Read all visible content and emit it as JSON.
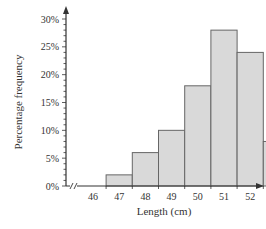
{
  "chart_data": {
    "type": "bar",
    "title": "",
    "xlabel": "Length (cm)",
    "ylabel": "Percentage frequency",
    "categories": [
      "47",
      "48",
      "49",
      "50",
      "51",
      "52",
      "53",
      "54"
    ],
    "bins": [
      [
        46.5,
        47.5
      ],
      [
        47.5,
        48.5
      ],
      [
        48.5,
        49.5
      ],
      [
        49.5,
        50.5
      ],
      [
        50.5,
        51.5
      ],
      [
        51.5,
        52.5
      ],
      [
        52.5,
        53.5
      ],
      [
        53.5,
        54.5
      ]
    ],
    "values": [
      2,
      6,
      10,
      18,
      28,
      24,
      8,
      4
    ],
    "x_ticks": [
      "46",
      "47",
      "48",
      "49",
      "50",
      "51",
      "52",
      "53",
      "54",
      "55"
    ],
    "y_ticks": [
      "0%",
      "5%",
      "10%",
      "15%",
      "20%",
      "25%",
      "30%"
    ],
    "ylim": [
      0,
      30
    ],
    "xlim": [
      45.5,
      55.5
    ],
    "grid": false,
    "axis_break": true,
    "bar_color": "#d9d9d9",
    "bar_edge_color": "#666666"
  }
}
